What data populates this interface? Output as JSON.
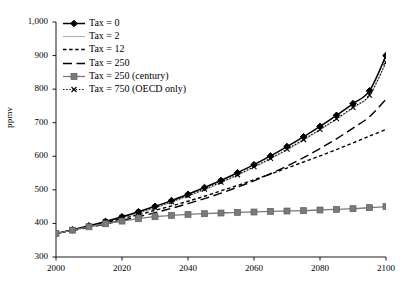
{
  "chart_data": {
    "type": "line",
    "title": "",
    "xlabel": "",
    "ylabel": "ppmv",
    "xlim": [
      2000,
      2100
    ],
    "ylim": [
      300,
      1000
    ],
    "grid": false,
    "legend_position": "top-left",
    "xticks": [
      "2000",
      "2020",
      "2040",
      "2060",
      "2080",
      "2100"
    ],
    "yticks": [
      "300",
      "400",
      "500",
      "600",
      "700",
      "800",
      "900",
      "1,000"
    ],
    "x": [
      2000,
      2005,
      2010,
      2015,
      2020,
      2025,
      2030,
      2035,
      2040,
      2045,
      2050,
      2055,
      2060,
      2065,
      2070,
      2075,
      2080,
      2085,
      2090,
      2095,
      2100
    ],
    "series": [
      {
        "name": "Tax = 0",
        "style": "solid-marker-diamond",
        "color": "#000000",
        "values": [
          370,
          381,
          393,
          406,
          420,
          435,
          451,
          468,
          487,
          507,
          528,
          551,
          575,
          601,
          629,
          658,
          689,
          722,
          757,
          795,
          900
        ]
      },
      {
        "name": "Tax = 2",
        "style": "solid-light",
        "color": "#b0b0b0",
        "values": [
          370,
          381,
          392,
          404,
          417,
          431,
          446,
          463,
          481,
          500,
          521,
          543,
          567,
          592,
          619,
          648,
          678,
          710,
          744,
          780,
          880
        ]
      },
      {
        "name": "Tax = 12",
        "style": "short-dash",
        "color": "#000000",
        "values": [
          370,
          380,
          391,
          402,
          414,
          426,
          439,
          452,
          466,
          481,
          497,
          513,
          530,
          547,
          565,
          583,
          601,
          620,
          640,
          660,
          680
        ]
      },
      {
        "name": "Tax = 250",
        "style": "long-dash",
        "color": "#000000",
        "values": [
          370,
          379,
          388,
          398,
          409,
          420,
          432,
          445,
          459,
          474,
          490,
          508,
          527,
          548,
          571,
          596,
          623,
          652,
          684,
          718,
          770
        ]
      },
      {
        "name": "Tax = 250 (century)",
        "style": "solid-marker-square",
        "color": "#7a7a7a",
        "values": [
          370,
          380,
          390,
          399,
          407,
          414,
          420,
          424,
          427,
          429,
          431,
          433,
          434,
          436,
          437,
          438,
          440,
          442,
          444,
          447,
          450
        ]
      },
      {
        "name": "Tax = 750 (OECD only)",
        "style": "dotted-marker-x",
        "color": "#000000",
        "values": [
          370,
          381,
          392,
          405,
          418,
          433,
          448,
          465,
          483,
          502,
          523,
          545,
          569,
          594,
          621,
          650,
          680,
          712,
          746,
          782,
          880
        ]
      }
    ]
  }
}
